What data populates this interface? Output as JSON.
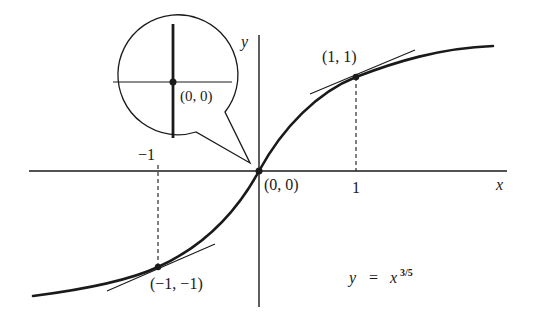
{
  "figure": {
    "equation": {
      "lhs": "y",
      "eq": "=",
      "base": "x",
      "exponent": "3/5"
    },
    "axes": {
      "x_label": "x",
      "y_label": "y",
      "ticks": [
        {
          "value": -1,
          "label": "−1"
        },
        {
          "value": 1,
          "label": "1"
        }
      ]
    },
    "points": [
      {
        "x": 0,
        "y": 0,
        "label": "(0, 0)"
      },
      {
        "x": 1,
        "y": 1,
        "label": "(1, 1)"
      },
      {
        "x": -1,
        "y": -1,
        "label": "(−1, −1)"
      }
    ],
    "inset": {
      "label": "(0, 0)",
      "description": "Magnified view at origin showing vertical tangent"
    },
    "colors": {
      "ink": "#1a1a1a",
      "background": "#ffffff"
    }
  }
}
